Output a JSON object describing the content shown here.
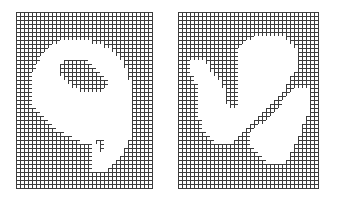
{
  "figures": [
    {
      "name": "grid-digit-9",
      "origin": [
        16,
        12
      ],
      "cell": 4,
      "cols": 34,
      "rows": 44,
      "line_color": "#3c3c3c",
      "white_spans": [
        [
          7,
          [
            [
              11,
              19
            ]
          ]
        ],
        [
          8,
          [
            [
              9,
              22
            ]
          ]
        ],
        [
          9,
          [
            [
              8,
              24
            ]
          ]
        ],
        [
          10,
          [
            [
              7,
              25
            ]
          ]
        ],
        [
          11,
          [
            [
              6,
              26
            ]
          ]
        ],
        [
          12,
          [
            [
              6,
              12
            ],
            [
              18,
              27
            ]
          ]
        ],
        [
          13,
          [
            [
              5,
              11
            ],
            [
              19,
              27
            ]
          ]
        ],
        [
          14,
          [
            [
              5,
              11
            ],
            [
              20,
              28
            ]
          ]
        ],
        [
          15,
          [
            [
              4,
              11
            ],
            [
              21,
              28
            ]
          ]
        ],
        [
          16,
          [
            [
              4,
              12
            ],
            [
              22,
              28
            ]
          ]
        ],
        [
          17,
          [
            [
              4,
              13
            ],
            [
              23,
              29
            ]
          ]
        ],
        [
          18,
          [
            [
              4,
              14
            ],
            [
              23,
              29
            ]
          ]
        ],
        [
          19,
          [
            [
              4,
              16
            ],
            [
              22,
              29
            ]
          ]
        ],
        [
          20,
          [
            [
              4,
              29
            ]
          ]
        ],
        [
          21,
          [
            [
              4,
              29
            ]
          ]
        ],
        [
          22,
          [
            [
              4,
              29
            ]
          ]
        ],
        [
          23,
          [
            [
              4,
              29
            ]
          ]
        ],
        [
          24,
          [
            [
              5,
              29
            ]
          ]
        ],
        [
          25,
          [
            [
              6,
              29
            ]
          ]
        ],
        [
          26,
          [
            [
              7,
              29
            ]
          ]
        ],
        [
          27,
          [
            [
              8,
              29
            ]
          ]
        ],
        [
          28,
          [
            [
              9,
              29
            ]
          ]
        ],
        [
          29,
          [
            [
              10,
              29
            ]
          ]
        ],
        [
          30,
          [
            [
              12,
              29
            ]
          ]
        ],
        [
          31,
          [
            [
              14,
              29
            ]
          ]
        ],
        [
          32,
          [
            [
              16,
              20
            ],
            [
              22,
              28
            ]
          ]
        ],
        [
          33,
          [
            [
              19,
              21
            ],
            [
              22,
              28
            ]
          ]
        ],
        [
          34,
          [
            [
              19,
              21
            ],
            [
              22,
              27
            ]
          ]
        ],
        [
          35,
          [
            [
              19,
              27
            ]
          ]
        ],
        [
          36,
          [
            [
              19,
              26
            ]
          ]
        ],
        [
          37,
          [
            [
              19,
              25
            ]
          ]
        ],
        [
          38,
          [
            [
              19,
              24
            ]
          ]
        ],
        [
          39,
          [
            [
              19,
              23
            ]
          ]
        ]
      ]
    },
    {
      "name": "grid-digit-u",
      "origin": [
        178,
        12
      ],
      "cell": 4,
      "cols": 35,
      "rows": 44,
      "line_color": "#3c3c3c",
      "white_spans": [
        [
          6,
          [
            [
              19,
              27
            ]
          ]
        ],
        [
          7,
          [
            [
              17,
              28
            ]
          ]
        ],
        [
          8,
          [
            [
              16,
              29
            ]
          ]
        ],
        [
          9,
          [
            [
              15,
              30
            ]
          ]
        ],
        [
          10,
          [
            [
              15,
              30
            ]
          ]
        ],
        [
          11,
          [
            [
              15,
              30
            ]
          ]
        ],
        [
          12,
          [
            [
              3,
              7
            ],
            [
              15,
              30
            ]
          ]
        ],
        [
          13,
          [
            [
              3,
              8
            ],
            [
              15,
              30
            ]
          ]
        ],
        [
          14,
          [
            [
              3,
              8
            ],
            [
              15,
              30
            ]
          ]
        ],
        [
          15,
          [
            [
              3,
              9
            ],
            [
              15,
              29
            ]
          ]
        ],
        [
          16,
          [
            [
              4,
              10
            ],
            [
              15,
              28
            ]
          ]
        ],
        [
          17,
          [
            [
              4,
              11
            ],
            [
              15,
              28
            ]
          ]
        ],
        [
          18,
          [
            [
              5,
              11
            ],
            [
              15,
              27
            ]
          ]
        ],
        [
          19,
          [
            [
              5,
              12
            ],
            [
              15,
              27
            ],
            [
              29,
              33
            ]
          ]
        ],
        [
          20,
          [
            [
              5,
              12
            ],
            [
              15,
              26
            ],
            [
              28,
              33
            ]
          ]
        ],
        [
          21,
          [
            [
              5,
              12
            ],
            [
              15,
              25
            ],
            [
              27,
              33
            ]
          ]
        ],
        [
          22,
          [
            [
              5,
              12
            ],
            [
              15,
              24
            ],
            [
              26,
              33
            ]
          ]
        ],
        [
          23,
          [
            [
              5,
              13
            ],
            [
              15,
              23
            ],
            [
              26,
              33
            ]
          ]
        ],
        [
          24,
          [
            [
              5,
              22
            ],
            [
              25,
              33
            ]
          ]
        ],
        [
          25,
          [
            [
              5,
              21
            ],
            [
              24,
              33
            ]
          ]
        ],
        [
          26,
          [
            [
              5,
              20
            ],
            [
              23,
              32
            ]
          ]
        ],
        [
          27,
          [
            [
              6,
              19
            ],
            [
              22,
              32
            ]
          ]
        ],
        [
          28,
          [
            [
              6,
              18
            ],
            [
              20,
              31
            ]
          ]
        ],
        [
          29,
          [
            [
              6,
              17
            ],
            [
              19,
              31
            ]
          ]
        ],
        [
          30,
          [
            [
              7,
              16
            ],
            [
              18,
              31
            ]
          ]
        ],
        [
          31,
          [
            [
              8,
              15
            ],
            [
              18,
              30
            ]
          ]
        ],
        [
          32,
          [
            [
              9,
              14
            ],
            [
              18,
              30
            ]
          ]
        ],
        [
          33,
          [
            [
              18,
              29
            ]
          ]
        ],
        [
          34,
          [
            [
              19,
              29
            ]
          ]
        ],
        [
          35,
          [
            [
              20,
              28
            ]
          ]
        ],
        [
          36,
          [
            [
              21,
              28
            ]
          ]
        ],
        [
          37,
          [
            [
              22,
              27
            ]
          ]
        ]
      ]
    }
  ]
}
